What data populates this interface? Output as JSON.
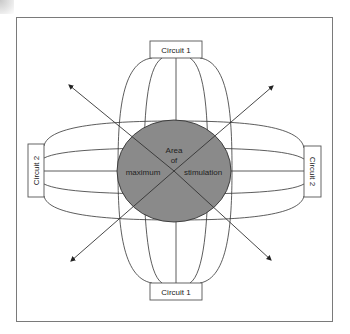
{
  "diagram": {
    "title": "",
    "labels": {
      "circuit1_top": "Circuit 1",
      "circuit1_bottom": "Circuit 1",
      "circuit2_left": "Circuit 2",
      "circuit2_right": "Circuit 2",
      "center_line1": "Area",
      "center_line2": "of",
      "center_left": "maximum",
      "center_right": "stimulation"
    },
    "colors": {
      "stimulation_area": "#8a8a8a",
      "lines": "#333333",
      "frame": "#7a7a7a"
    },
    "nodes": [
      {
        "id": "circuit1_top",
        "label": "Circuit 1",
        "position": "top"
      },
      {
        "id": "circuit1_bottom",
        "label": "Circuit 1",
        "position": "bottom"
      },
      {
        "id": "circuit2_left",
        "label": "Circuit 2",
        "position": "left"
      },
      {
        "id": "circuit2_right",
        "label": "Circuit 2",
        "position": "right"
      },
      {
        "id": "center",
        "label": "Area of maximum stimulation",
        "position": "center"
      }
    ],
    "arrows": [
      {
        "direction": "upper-left"
      },
      {
        "direction": "upper-right"
      },
      {
        "direction": "lower-left"
      },
      {
        "direction": "lower-right"
      }
    ]
  }
}
